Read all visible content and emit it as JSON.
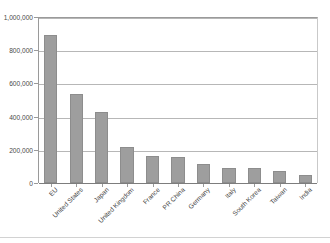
{
  "chart_data": {
    "type": "bar",
    "title": "",
    "subtitle": "",
    "xlabel": "",
    "ylabel": "",
    "categories": [
      "EU",
      "United States",
      "Japan",
      "United Kingdom",
      "France",
      "PR China",
      "Germany",
      "Italy",
      "South Korea",
      "Taiwan",
      "India"
    ],
    "values": [
      890000,
      535000,
      425000,
      215000,
      165000,
      155000,
      115000,
      92000,
      90000,
      72000,
      50000
    ],
    "series": [
      {
        "name": "Value",
        "values": [
          890000,
          535000,
          425000,
          215000,
          165000,
          155000,
          115000,
          92000,
          90000,
          72000,
          50000
        ]
      }
    ],
    "ylim": [
      0,
      1000000
    ],
    "yticks": [
      0,
      200000,
      400000,
      600000,
      800000,
      1000000
    ],
    "ytick_labels": [
      "0",
      "200,000",
      "400,000",
      "600,000",
      "800,000",
      "1,000,000"
    ],
    "grid": true,
    "grid_axis": "y",
    "legend": false,
    "legend_position": "none",
    "bar_color": "#9e9e9e",
    "bar_edge_color": "#8d8d8d",
    "gridline_color": "#b7b7b7",
    "axis_color": "#9a9a9a",
    "xtick_rotation": -45
  },
  "axis": {
    "y": {
      "ticks": [
        {
          "label": "1,000,000",
          "value": 1000000
        },
        {
          "label": "800,000",
          "value": 800000
        },
        {
          "label": "600,000",
          "value": 600000
        },
        {
          "label": "400,000",
          "value": 400000
        },
        {
          "label": "200,000",
          "value": 200000
        },
        {
          "label": "0",
          "value": 0
        }
      ]
    },
    "x": {
      "ticks": [
        {
          "label": "EU"
        },
        {
          "label": "United States"
        },
        {
          "label": "Japan"
        },
        {
          "label": "United Kingdom"
        },
        {
          "label": "France"
        },
        {
          "label": "PR China"
        },
        {
          "label": "Germany"
        },
        {
          "label": "Italy"
        },
        {
          "label": "South Korea"
        },
        {
          "label": "Taiwan"
        },
        {
          "label": "India"
        }
      ]
    }
  }
}
